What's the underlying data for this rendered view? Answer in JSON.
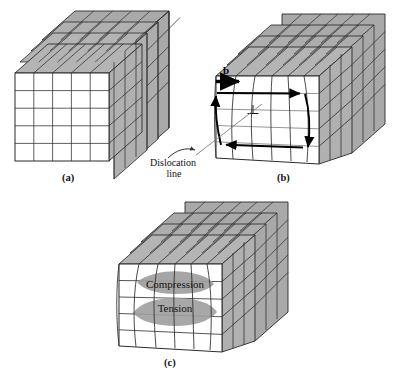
{
  "figure": {
    "title_visible": false,
    "background_color": "#ffffff",
    "panels": [
      {
        "id": "a",
        "caption": "(a)",
        "description": "perfect-crystal-block",
        "labels": []
      },
      {
        "id": "b",
        "caption": "(b)",
        "description": "edge-dislocation-burgers-circuit",
        "labels": [
          {
            "name": "burgers-vector",
            "text": "b"
          },
          {
            "name": "dislocation-symbol",
            "text": "⊥"
          },
          {
            "name": "dislocation-line-line1",
            "text": "Dislocation"
          },
          {
            "name": "dislocation-line-line2",
            "text": "line"
          }
        ]
      },
      {
        "id": "c",
        "caption": "(c)",
        "description": "strain-field-compression-tension",
        "labels": [
          {
            "name": "compression-zone",
            "text": "Compression"
          },
          {
            "name": "tension-zone",
            "text": "Tension"
          }
        ]
      }
    ]
  },
  "colors": {
    "face_front": "#ffffff",
    "face_shaded": "#a9a9a9",
    "face_shaded_light": "#b4b4b4",
    "zone_shade": "#9e9e9e",
    "line": "#2b2b2b",
    "line_light": "#6f6f6f",
    "arrow": "#000000",
    "text": "#111111"
  },
  "captions": {
    "a": "(a)",
    "b": "(b)",
    "c": "(c)"
  },
  "panel_b": {
    "burgers_label": "b",
    "dislocation_symbol": "⊥",
    "dislocation_line_text_1": "Dislocation",
    "dislocation_line_text_2": "line"
  },
  "panel_c": {
    "compression_label": "Compression",
    "tension_label": "Tension"
  },
  "grid": {
    "front_rows": 5,
    "front_cols": 5,
    "depth_slabs": 4
  }
}
